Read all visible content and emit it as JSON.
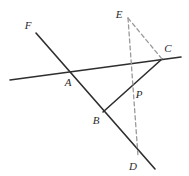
{
  "figure": {
    "kind": "geometry-diagram",
    "width": 189,
    "height": 176,
    "background_color": "#ffffff",
    "solid_stroke_color": "#2e2e2e",
    "dashed_stroke_color": "#9a9a9a",
    "solid_stroke_width": 1.6,
    "dashed_stroke_width": 1.3,
    "dash_pattern": "4,3"
  },
  "points": [
    {
      "id": "F",
      "label": "F",
      "label_x": 28,
      "label_y": 25,
      "x": 36,
      "y": 33
    },
    {
      "id": "A",
      "label": "A",
      "label_x": 68,
      "label_y": 82,
      "x": 68,
      "y": 71
    },
    {
      "id": "B",
      "label": "B",
      "label_x": 96,
      "label_y": 120,
      "x": 103,
      "y": 112
    },
    {
      "id": "D",
      "label": "D",
      "label_x": 133,
      "label_y": 166,
      "x": 150,
      "y": 165
    },
    {
      "id": "C",
      "label": "C",
      "label_x": 168,
      "label_y": 48,
      "x": 162,
      "y": 59
    },
    {
      "id": "E",
      "label": "E",
      "label_x": 119,
      "label_y": 14,
      "x": 128,
      "y": 18
    },
    {
      "id": "P",
      "label": "P",
      "label_x": 139,
      "label_y": 94,
      "x": 131,
      "y": 87
    }
  ],
  "segments": [
    {
      "id": "ray-F-A-B-D",
      "name": "line-through-F-A-B-D",
      "style": "solid",
      "x1": 36,
      "y1": 33,
      "x2": 155,
      "y2": 169
    },
    {
      "id": "transversal",
      "name": "transversal-line-through-A-and-C",
      "style": "solid",
      "x1": 10,
      "y1": 80,
      "x2": 181,
      "y2": 57
    },
    {
      "id": "seg-B-P-C",
      "name": "segment-B-to-C-through-P",
      "style": "solid",
      "x1": 103,
      "y1": 112,
      "x2": 162,
      "y2": 59
    },
    {
      "id": "seg-E-C",
      "name": "dashed-segment-E-to-C",
      "style": "dashed",
      "x1": 128,
      "y1": 18,
      "x2": 162,
      "y2": 59
    },
    {
      "id": "seg-E-D",
      "name": "dashed-segment-E-through-P-to-D",
      "style": "dashed",
      "x1": 128,
      "y1": 18,
      "x2": 138,
      "y2": 156
    }
  ]
}
